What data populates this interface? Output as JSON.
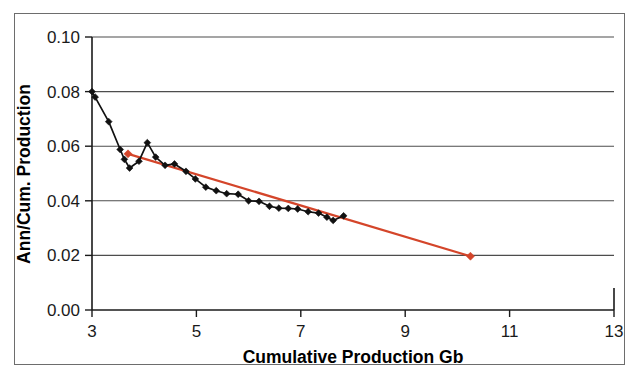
{
  "chart_data": {
    "type": "line",
    "title": "",
    "subtitle": "",
    "xlabel": "Cumulative Production Gb",
    "ylabel": "Ann/Cum. Production",
    "xlim": [
      3,
      13
    ],
    "ylim": [
      0.0,
      0.1
    ],
    "xticks": [
      3,
      5,
      7,
      9,
      11,
      13
    ],
    "xtick_labels": [
      "3",
      "5",
      "7",
      "9",
      "11",
      "13"
    ],
    "yticks": [
      0.0,
      0.02,
      0.04,
      0.06,
      0.08,
      0.1
    ],
    "ytick_labels": [
      "0.00",
      "0.02",
      "0.04",
      "0.06",
      "0.08",
      "0.10"
    ],
    "grid": "horizontal",
    "legend": "none",
    "series": [
      {
        "name": "Ann/Cum. Production",
        "type": "line",
        "color": "#111111",
        "marker": "diamond",
        "points": [
          [
            3.0,
            0.08
          ],
          [
            3.06,
            0.078
          ],
          [
            3.32,
            0.069
          ],
          [
            3.54,
            0.0588
          ],
          [
            3.62,
            0.0552
          ],
          [
            3.72,
            0.052
          ],
          [
            3.9,
            0.0545
          ],
          [
            4.06,
            0.0613
          ],
          [
            4.22,
            0.056
          ],
          [
            4.4,
            0.053
          ],
          [
            4.58,
            0.0535
          ],
          [
            4.8,
            0.0508
          ],
          [
            4.98,
            0.048
          ],
          [
            5.18,
            0.045
          ],
          [
            5.38,
            0.0437
          ],
          [
            5.58,
            0.0426
          ],
          [
            5.8,
            0.0424
          ],
          [
            6.0,
            0.04
          ],
          [
            6.2,
            0.0398
          ],
          [
            6.4,
            0.038
          ],
          [
            6.58,
            0.0373
          ],
          [
            6.76,
            0.0372
          ],
          [
            6.94,
            0.037
          ],
          [
            7.14,
            0.036
          ],
          [
            7.34,
            0.0355
          ],
          [
            7.5,
            0.034
          ],
          [
            7.62,
            0.0328
          ],
          [
            7.82,
            0.0345
          ]
        ]
      },
      {
        "name": "Linear trend",
        "type": "line",
        "color": "#d4452a",
        "marker": "endpoint",
        "points": [
          [
            3.69,
            0.0572
          ],
          [
            10.25,
            0.0197
          ]
        ]
      }
    ],
    "annotations": []
  }
}
